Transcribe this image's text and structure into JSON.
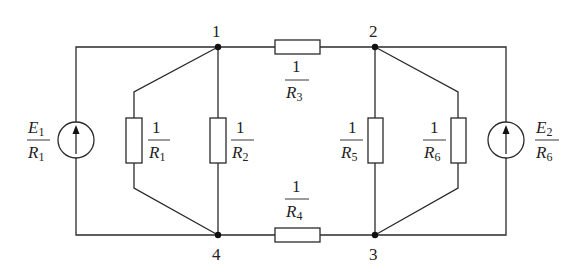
{
  "diagram": {
    "type": "electrical circuit (nodal analysis)",
    "nodes": [
      {
        "id": "1",
        "label": "1"
      },
      {
        "id": "2",
        "label": "2"
      },
      {
        "id": "3",
        "label": "3"
      },
      {
        "id": "4",
        "label": "4"
      }
    ],
    "sources": [
      {
        "id": "J1",
        "num": "E",
        "num_sub": "1",
        "den": "R",
        "den_sub": "1",
        "between": [
          "4",
          "1"
        ],
        "direction": "up"
      },
      {
        "id": "J2",
        "num": "E",
        "num_sub": "2",
        "den": "R",
        "den_sub": "6",
        "between": [
          "3",
          "2"
        ],
        "direction": "up"
      }
    ],
    "conductances": [
      {
        "id": "G1",
        "num": "1",
        "den": "R",
        "den_sub": "1",
        "between": [
          "1",
          "4"
        ]
      },
      {
        "id": "G2",
        "num": "1",
        "den": "R",
        "den_sub": "2",
        "between": [
          "1",
          "4"
        ]
      },
      {
        "id": "G3",
        "num": "1",
        "den": "R",
        "den_sub": "3",
        "between": [
          "1",
          "2"
        ]
      },
      {
        "id": "G4",
        "num": "1",
        "den": "R",
        "den_sub": "4",
        "between": [
          "4",
          "3"
        ]
      },
      {
        "id": "G5",
        "num": "1",
        "den": "R",
        "den_sub": "5",
        "between": [
          "2",
          "3"
        ]
      },
      {
        "id": "G6",
        "num": "1",
        "den": "R",
        "den_sub": "6",
        "between": [
          "2",
          "3"
        ]
      }
    ]
  }
}
